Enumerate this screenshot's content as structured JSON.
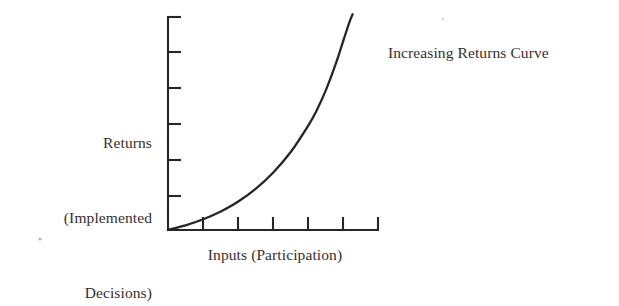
{
  "figure": {
    "name": "increasing-returns-curve-figure",
    "background_color": "#ffffff",
    "ink_color": "#262626",
    "annotation": "Increasing Returns Curve",
    "y_axis_label_lines": [
      "Returns",
      "(Implemented",
      "Decisions)"
    ],
    "x_axis_label": "Inputs (Participation)"
  },
  "chart_data": {
    "type": "line",
    "title": "",
    "subtitle": "",
    "xlabel": "Inputs (Participation)",
    "ylabel": "Returns (Implemented Decisions)",
    "annotations": [
      {
        "text": "Increasing Returns Curve",
        "anchor": "curve-upper-right",
        "x": 1.0,
        "y": 0.93
      }
    ],
    "grid": false,
    "legend": false,
    "legend_position": "none",
    "axis_tick_labels": {
      "x": [],
      "y": []
    },
    "xlim": [
      0,
      6
    ],
    "ylim": [
      0,
      6
    ],
    "x_tick_count": 6,
    "y_tick_count": 6,
    "series": [
      {
        "name": "Increasing Returns Curve",
        "x": [
          0.0,
          0.5,
          1.0,
          1.5,
          2.0,
          2.5,
          3.0,
          3.5,
          4.0,
          4.25,
          4.5,
          4.75,
          5.0,
          5.15,
          5.25
        ],
        "y": [
          0.0,
          0.13,
          0.3,
          0.52,
          0.8,
          1.16,
          1.62,
          2.2,
          2.95,
          3.4,
          3.95,
          4.6,
          5.35,
          5.8,
          6.05
        ]
      }
    ]
  }
}
